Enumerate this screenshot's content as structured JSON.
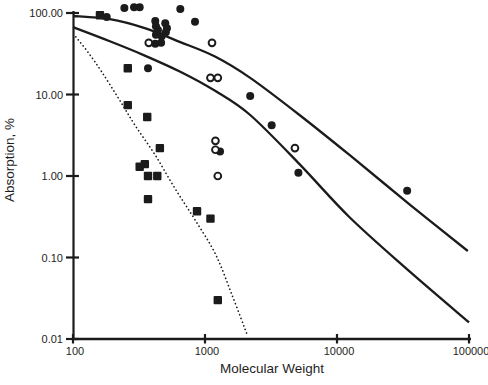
{
  "figure": {
    "background": "#ffffff",
    "ink_color": "#1b1b1b"
  },
  "chart_data": {
    "type": "scatter",
    "title": "",
    "xlabel": "Molecular Weight",
    "ylabel": "Absorption, %",
    "x_scale": "log",
    "y_scale": "log",
    "xlim": [
      100,
      100000
    ],
    "ylim": [
      0.01,
      100
    ],
    "grid": false,
    "legend": "none",
    "x_ticks": {
      "values": [
        100,
        1000,
        10000,
        100000
      ],
      "labels": [
        "100",
        "1000",
        "10000",
        "100000"
      ]
    },
    "y_ticks": {
      "values": [
        100,
        10,
        1,
        0.1,
        0.01
      ],
      "labels": [
        "100.00",
        "10.00",
        "1.00",
        "0.10",
        "0.01"
      ]
    },
    "series": [
      {
        "name": "filled-circle-points",
        "type": "scatter",
        "marker": "filled-circle",
        "points": [
          [
            245,
            115
          ],
          [
            290,
            118
          ],
          [
            320,
            118
          ],
          [
            650,
            112
          ],
          [
            180,
            89
          ],
          [
            420,
            80
          ],
          [
            425,
            69
          ],
          [
            440,
            62
          ],
          [
            425,
            54
          ],
          [
            500,
            75
          ],
          [
            515,
            65
          ],
          [
            505,
            58
          ],
          [
            470,
            52
          ],
          [
            420,
            42
          ],
          [
            465,
            43
          ],
          [
            370,
            21
          ],
          [
            840,
            78
          ],
          [
            1300,
            2.0
          ],
          [
            2200,
            9.6
          ],
          [
            3200,
            4.2
          ],
          [
            5100,
            1.1
          ],
          [
            34000,
            0.66
          ]
        ]
      },
      {
        "name": "open-circle-points",
        "type": "scatter",
        "marker": "open-circle",
        "points": [
          [
            375,
            43
          ],
          [
            1130,
            43
          ],
          [
            1100,
            16
          ],
          [
            1250,
            16
          ],
          [
            1200,
            2.7
          ],
          [
            1200,
            2.1
          ],
          [
            1250,
            1.0
          ],
          [
            4800,
            2.2
          ]
        ]
      },
      {
        "name": "filled-square-points",
        "type": "scatter",
        "marker": "filled-square",
        "points": [
          [
            160,
            94
          ],
          [
            260,
            21
          ],
          [
            260,
            7.4
          ],
          [
            365,
            5.3
          ],
          [
            455,
            2.2
          ],
          [
            320,
            1.3
          ],
          [
            350,
            1.4
          ],
          [
            370,
            1.0
          ],
          [
            435,
            1.0
          ],
          [
            370,
            0.52
          ],
          [
            870,
            0.37
          ],
          [
            1100,
            0.3
          ],
          [
            1250,
            0.03
          ]
        ]
      },
      {
        "name": "upper-solid-curve",
        "type": "curve",
        "line_style": "solid",
        "points": [
          [
            100,
            92
          ],
          [
            190,
            84
          ],
          [
            350,
            65
          ],
          [
            650,
            44
          ],
          [
            1200,
            29
          ],
          [
            2200,
            16
          ],
          [
            5200,
            5.6
          ],
          [
            12500,
            1.8
          ],
          [
            36000,
            0.44
          ],
          [
            98000,
            0.12
          ]
        ]
      },
      {
        "name": "lower-solid-curve",
        "type": "curve",
        "line_style": "solid",
        "points": [
          [
            100,
            67
          ],
          [
            190,
            45
          ],
          [
            350,
            30
          ],
          [
            650,
            19
          ],
          [
            1200,
            11
          ],
          [
            2200,
            5.6
          ],
          [
            5200,
            1.4
          ],
          [
            12500,
            0.31
          ],
          [
            36000,
            0.066
          ],
          [
            100000,
            0.016
          ]
        ]
      },
      {
        "name": "dotted-curve",
        "type": "curve",
        "line_style": "dotted",
        "points": [
          [
            105,
            51
          ],
          [
            130,
            33
          ],
          [
            165,
            19
          ],
          [
            220,
            9.1
          ],
          [
            295,
            4.2
          ],
          [
            420,
            1.8
          ],
          [
            590,
            0.71
          ],
          [
            840,
            0.29
          ],
          [
            1200,
            0.11
          ],
          [
            1600,
            0.035
          ],
          [
            2100,
            0.011
          ]
        ]
      }
    ]
  }
}
